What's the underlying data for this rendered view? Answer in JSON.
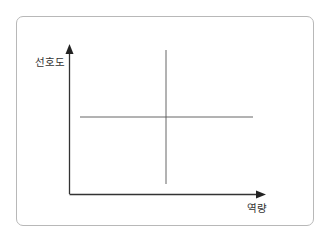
{
  "diagram": {
    "type": "quadrant-matrix",
    "y_axis_label": "선호도",
    "x_axis_label": "역량",
    "colors": {
      "frame_border": "#b8b8b8",
      "axis": "#333333",
      "divider": "#555555"
    }
  }
}
